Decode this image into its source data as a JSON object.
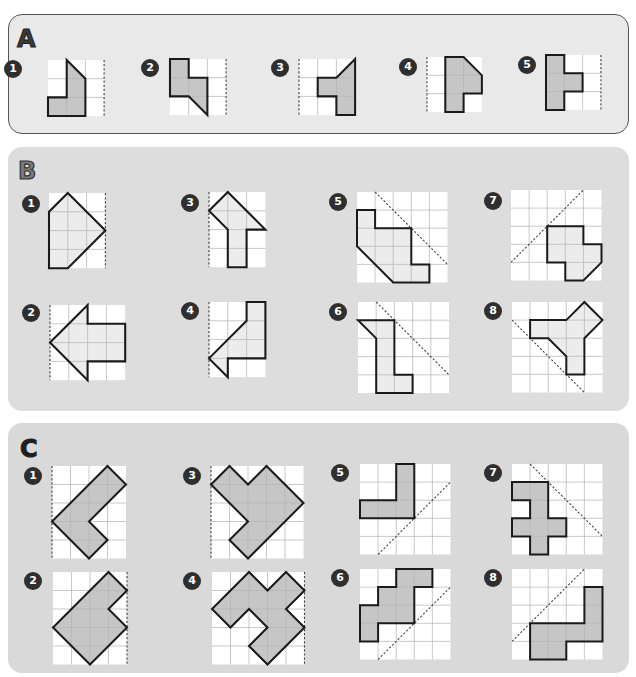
{
  "colors": {
    "grid_line": "#b5b5b5",
    "cell_bg": "#ffffff",
    "outline": "#1a1a1a",
    "dashed": "#444444",
    "fill_dark": "#c6c6c6",
    "fill_light": "#ececec",
    "badge_bg": "#2f2f2f"
  },
  "sections": [
    {
      "letter": "A",
      "fill": "dark",
      "puzzles": [
        {
          "number": "1",
          "cols": 3,
          "rows": 3,
          "x": 48,
          "y": 60,
          "cell": 18.7,
          "badge": [
            4,
            60
          ],
          "shape": [
            [
              1,
              0
            ],
            [
              2,
              1
            ],
            [
              2,
              3
            ],
            [
              0,
              3
            ],
            [
              0,
              2
            ],
            [
              1,
              2
            ]
          ],
          "mirror": [
            [
              3,
              0
            ],
            [
              3,
              3
            ]
          ]
        },
        {
          "number": "2",
          "cols": 3,
          "rows": 3,
          "x": 170,
          "y": 59,
          "cell": 18.7,
          "badge": [
            141,
            59
          ],
          "shape": [
            [
              0,
              0
            ],
            [
              1,
              0
            ],
            [
              1,
              1
            ],
            [
              2,
              1
            ],
            [
              2,
              3
            ],
            [
              1,
              2
            ],
            [
              0,
              2
            ]
          ],
          "mirror": [
            [
              3,
              0
            ],
            [
              3,
              3
            ]
          ]
        },
        {
          "number": "3",
          "cols": 3,
          "rows": 3,
          "x": 299,
          "y": 59,
          "cell": 18.7,
          "badge": [
            271,
            59
          ],
          "shape": [
            [
              3,
              0
            ],
            [
              3,
              3
            ],
            [
              2,
              3
            ],
            [
              2,
              2
            ],
            [
              1,
              2
            ],
            [
              1,
              1
            ],
            [
              2,
              1
            ]
          ],
          "mirror": [
            [
              0,
              0
            ],
            [
              0,
              3
            ]
          ]
        },
        {
          "number": "4",
          "cols": 3,
          "rows": 3,
          "x": 427,
          "y": 57,
          "cell": 18.3,
          "badge": [
            399,
            58
          ],
          "shape": [
            [
              1,
              0
            ],
            [
              2,
              0
            ],
            [
              3,
              1
            ],
            [
              3,
              2
            ],
            [
              2,
              2
            ],
            [
              2,
              3
            ],
            [
              1,
              3
            ]
          ],
          "mirror": [
            [
              0,
              0
            ],
            [
              0,
              3
            ]
          ]
        },
        {
          "number": "5",
          "cols": 3,
          "rows": 3,
          "x": 546,
          "y": 55,
          "cell": 18.3,
          "badge": [
            518,
            56
          ],
          "shape": [
            [
              0,
              0
            ],
            [
              1,
              0
            ],
            [
              1,
              1
            ],
            [
              2,
              1
            ],
            [
              2,
              2
            ],
            [
              1,
              2
            ],
            [
              1,
              3
            ],
            [
              0,
              3
            ]
          ],
          "mirror": [
            [
              3,
              0
            ],
            [
              3,
              3
            ]
          ]
        }
      ]
    },
    {
      "letter": "B",
      "fill": "light",
      "puzzles": [
        {
          "number": "1",
          "cols": 3,
          "rows": 4,
          "x": 49,
          "y": 193,
          "cell": 18.8,
          "badge": [
            22,
            195
          ],
          "shape": [
            [
              1,
              0
            ],
            [
              3,
              2
            ],
            [
              1,
              4
            ],
            [
              0,
              4
            ],
            [
              0,
              1
            ]
          ],
          "mirror": [
            [
              3,
              0
            ],
            [
              3,
              4
            ]
          ]
        },
        {
          "number": "3",
          "cols": 3,
          "rows": 4,
          "x": 209,
          "y": 192,
          "cell": 18.8,
          "badge": [
            181,
            194
          ],
          "shape": [
            [
              1,
              0
            ],
            [
              3,
              2
            ],
            [
              2,
              2
            ],
            [
              2,
              4
            ],
            [
              1,
              4
            ],
            [
              1,
              2
            ],
            [
              0,
              1
            ]
          ],
          "mirror": [
            [
              0,
              0
            ],
            [
              0,
              4
            ]
          ]
        },
        {
          "number": "5",
          "cols": 5,
          "rows": 5,
          "x": 357,
          "y": 192,
          "cell": 18.1,
          "badge": [
            329,
            193
          ],
          "shape": [
            [
              0,
              1
            ],
            [
              1,
              1
            ],
            [
              1,
              2
            ],
            [
              3,
              2
            ],
            [
              3,
              4
            ],
            [
              4,
              4
            ],
            [
              4,
              5
            ],
            [
              2,
              5
            ],
            [
              0,
              3
            ]
          ],
          "mirror": [
            [
              1,
              0
            ],
            [
              5,
              4
            ]
          ]
        },
        {
          "number": "7",
          "cols": 5,
          "rows": 5,
          "x": 511,
          "y": 190,
          "cell": 18.1,
          "badge": [
            484,
            192
          ],
          "shape": [
            [
              2,
              2
            ],
            [
              4,
              2
            ],
            [
              4,
              3
            ],
            [
              5,
              3
            ],
            [
              5,
              4
            ],
            [
              4,
              5
            ],
            [
              3,
              5
            ],
            [
              3,
              4
            ],
            [
              2,
              4
            ]
          ],
          "mirror": [
            [
              0,
              4
            ],
            [
              4,
              0
            ]
          ]
        },
        {
          "number": "2",
          "cols": 4,
          "rows": 4,
          "x": 50,
          "y": 305,
          "cell": 18.8,
          "badge": [
            22,
            304
          ],
          "shape": [
            [
              0,
              2
            ],
            [
              2,
              0
            ],
            [
              2,
              1
            ],
            [
              4,
              1
            ],
            [
              4,
              3
            ],
            [
              2,
              3
            ],
            [
              2,
              4
            ]
          ],
          "mirror": [
            [
              0,
              0
            ],
            [
              0,
              4
            ]
          ]
        },
        {
          "number": "4",
          "cols": 3,
          "rows": 4,
          "x": 209,
          "y": 302,
          "cell": 18.8,
          "badge": [
            181,
            302
          ],
          "shape": [
            [
              2,
              0
            ],
            [
              3,
              0
            ],
            [
              3,
              3
            ],
            [
              1,
              3
            ],
            [
              1,
              4
            ],
            [
              0,
              3
            ],
            [
              2,
              1
            ]
          ],
          "mirror": [
            [
              0,
              0
            ],
            [
              0,
              4
            ]
          ]
        },
        {
          "number": "6",
          "cols": 5,
          "rows": 5,
          "x": 358,
          "y": 302,
          "cell": 18.2,
          "badge": [
            329,
            303
          ],
          "shape": [
            [
              0,
              1
            ],
            [
              2,
              1
            ],
            [
              2,
              4
            ],
            [
              3,
              4
            ],
            [
              3,
              5
            ],
            [
              1,
              5
            ],
            [
              1,
              2
            ]
          ],
          "mirror": [
            [
              1,
              0
            ],
            [
              5,
              4
            ]
          ]
        },
        {
          "number": "8",
          "cols": 5,
          "rows": 5,
          "x": 512,
          "y": 302,
          "cell": 18.1,
          "badge": [
            484,
            302
          ],
          "shape": [
            [
              1,
              1
            ],
            [
              3,
              1
            ],
            [
              4,
              0
            ],
            [
              5,
              1
            ],
            [
              4,
              2
            ],
            [
              4,
              4
            ],
            [
              3,
              4
            ],
            [
              3,
              3
            ],
            [
              2,
              2
            ],
            [
              1,
              2
            ]
          ],
          "mirror": [
            [
              0,
              1
            ],
            [
              4,
              5
            ]
          ]
        }
      ]
    },
    {
      "letter": "C",
      "fill": "dark",
      "puzzles": [
        {
          "number": "1",
          "cols": 4,
          "rows": 5,
          "x": 52,
          "y": 466,
          "cell": 18.5,
          "badge": [
            24,
            467
          ],
          "shape": [
            [
              3,
              0
            ],
            [
              4,
              1
            ],
            [
              2,
              3
            ],
            [
              3,
              4
            ],
            [
              2,
              5
            ],
            [
              0,
              3
            ]
          ],
          "mirror": [
            [
              0,
              0
            ],
            [
              0,
              5
            ]
          ]
        },
        {
          "number": "3",
          "cols": 5,
          "rows": 5,
          "x": 211,
          "y": 466,
          "cell": 18.5,
          "badge": [
            183,
            467
          ],
          "shape": [
            [
              1,
              0
            ],
            [
              2,
              1
            ],
            [
              3,
              0
            ],
            [
              5,
              2
            ],
            [
              2,
              5
            ],
            [
              1,
              4
            ],
            [
              2,
              3
            ],
            [
              0,
              1
            ]
          ],
          "mirror": [
            [
              0,
              0
            ],
            [
              0,
              5
            ]
          ]
        },
        {
          "number": "5",
          "cols": 5,
          "rows": 5,
          "x": 360,
          "y": 464,
          "cell": 18.1,
          "badge": [
            331,
            464
          ],
          "shape": [
            [
              2,
              0
            ],
            [
              3,
              0
            ],
            [
              3,
              3
            ],
            [
              0,
              3
            ],
            [
              0,
              2
            ],
            [
              2,
              2
            ]
          ],
          "mirror": [
            [
              1,
              5
            ],
            [
              5,
              1
            ]
          ]
        },
        {
          "number": "7",
          "cols": 5,
          "rows": 5,
          "x": 512,
          "y": 464,
          "cell": 18.1,
          "badge": [
            484,
            464
          ],
          "shape": [
            [
              0,
              1
            ],
            [
              2,
              1
            ],
            [
              2,
              3
            ],
            [
              3,
              3
            ],
            [
              3,
              4
            ],
            [
              2,
              4
            ],
            [
              2,
              5
            ],
            [
              1,
              5
            ],
            [
              1,
              4
            ],
            [
              0,
              4
            ],
            [
              0,
              3
            ],
            [
              1,
              3
            ],
            [
              1,
              2
            ],
            [
              0,
              2
            ]
          ],
          "mirror": [
            [
              1,
              0
            ],
            [
              5,
              4
            ]
          ]
        },
        {
          "number": "2",
          "cols": 4,
          "rows": 5,
          "x": 53,
          "y": 572,
          "cell": 18.5,
          "badge": [
            24,
            572
          ],
          "shape": [
            [
              3,
              0
            ],
            [
              4,
              1
            ],
            [
              3,
              2
            ],
            [
              4,
              3
            ],
            [
              2,
              5
            ],
            [
              0,
              3
            ]
          ],
          "mirror": [
            [
              4,
              0
            ],
            [
              4,
              5
            ]
          ]
        },
        {
          "number": "4",
          "cols": 5,
          "rows": 5,
          "x": 212,
          "y": 572,
          "cell": 18.5,
          "badge": [
            183,
            572
          ],
          "shape": [
            [
              2,
              0
            ],
            [
              3,
              1
            ],
            [
              4,
              0
            ],
            [
              5,
              1
            ],
            [
              4,
              2
            ],
            [
              5,
              3
            ],
            [
              3,
              5
            ],
            [
              2,
              4
            ],
            [
              3,
              3
            ],
            [
              2,
              2
            ],
            [
              1,
              3
            ],
            [
              0,
              2
            ]
          ],
          "mirror": [
            [
              5,
              0
            ],
            [
              5,
              5
            ]
          ]
        },
        {
          "number": "6",
          "cols": 5,
          "rows": 5,
          "x": 360,
          "y": 569,
          "cell": 18.1,
          "badge": [
            331,
            569
          ],
          "shape": [
            [
              2,
              0
            ],
            [
              4,
              0
            ],
            [
              4,
              1
            ],
            [
              3,
              1
            ],
            [
              3,
              3
            ],
            [
              1,
              3
            ],
            [
              1,
              4
            ],
            [
              0,
              4
            ],
            [
              0,
              2
            ],
            [
              1,
              2
            ],
            [
              1,
              1
            ],
            [
              2,
              1
            ]
          ],
          "mirror": [
            [
              1,
              5
            ],
            [
              5,
              1
            ]
          ]
        },
        {
          "number": "8",
          "cols": 5,
          "rows": 5,
          "x": 512,
          "y": 569,
          "cell": 18.1,
          "badge": [
            484,
            569
          ],
          "shape": [
            [
              4,
              1
            ],
            [
              5,
              1
            ],
            [
              5,
              4
            ],
            [
              3,
              4
            ],
            [
              3,
              5
            ],
            [
              1,
              5
            ],
            [
              1,
              3
            ],
            [
              4,
              3
            ]
          ],
          "mirror": [
            [
              0,
              4
            ],
            [
              4,
              0
            ]
          ]
        }
      ]
    }
  ]
}
